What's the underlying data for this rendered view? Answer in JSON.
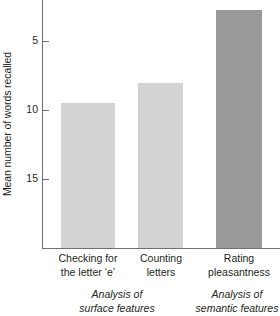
{
  "chart_data": {
    "type": "bar",
    "title": "",
    "xlabel": "",
    "ylabel": "Mean number of words recalled",
    "categories": [
      "Checking for the letter ‘e’",
      "Counting letters",
      "Rating pleasantness"
    ],
    "values": [
      10.5,
      12.0,
      17.3
    ],
    "ylim": [
      0,
      18
    ],
    "yticks": [
      5,
      10,
      15
    ],
    "ytick_labels": [
      "5",
      "10",
      "15"
    ],
    "grid": false,
    "legend": "none",
    "bar_colors": [
      "#d3d3d3",
      "#d3d3d3",
      "#999999"
    ],
    "axis_color": "#6f6f6f",
    "groups": [
      {
        "label_line1": "Analysis of",
        "label_line2": "surface features",
        "categories": [
          0,
          1
        ]
      },
      {
        "label_line1": "Analysis of",
        "label_line2": "semantic features",
        "categories": [
          2
        ]
      }
    ]
  },
  "axis": {
    "y_title": "Mean number of words recalled",
    "ticks": [
      {
        "value": "15"
      },
      {
        "value": "10"
      },
      {
        "value": "5"
      }
    ]
  },
  "categories": [
    {
      "line1": "Checking for",
      "line2": "the letter ‘e’"
    },
    {
      "line1": "Counting",
      "line2": "letters"
    },
    {
      "line1": "Rating",
      "line2": "pleasantness"
    }
  ],
  "groups": [
    {
      "line1": "Analysis of",
      "line2": "surface features"
    },
    {
      "line1": "Analysis of",
      "line2": "semantic features"
    }
  ]
}
